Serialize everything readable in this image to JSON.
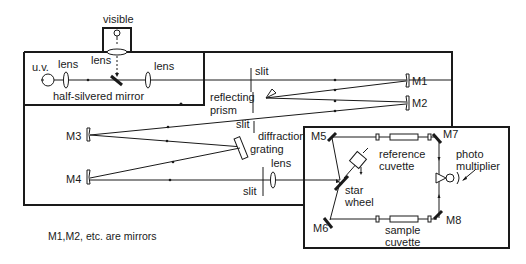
{
  "diagram": {
    "labels": {
      "visible": "visible",
      "uv": "u.v.",
      "lens_1": "lens",
      "lens_2": "lens",
      "lens_3": "lens",
      "lens_4": "lens",
      "half_silvered_mirror": "half-silvered mirror",
      "slit_1": "slit",
      "slit_2": "slit",
      "slit_3": "slit",
      "reflecting_prism_line1": "reflecting",
      "reflecting_prism_line2": "prism",
      "diffraction_grating_line1": "diffraction",
      "diffraction_grating_line2": "grating",
      "m1": "M1",
      "m2": "M2",
      "m3": "M3",
      "m4": "M4",
      "m5": "M5",
      "m6": "M6",
      "m7": "M7",
      "m8": "M8",
      "reference_cuvette_line1": "reference",
      "reference_cuvette_line2": "cuvette",
      "sample_cuvette_line1": "sample",
      "sample_cuvette_line2": "cuvette",
      "star_wheel_line1": "star",
      "star_wheel_line2": "wheel",
      "photomultiplier_line1": "photo",
      "photomultiplier_line2": "multiplier"
    },
    "note": "M1,M2, etc. are mirrors",
    "colors": {
      "ink": "#1a1a1a",
      "background": "#ffffff"
    }
  }
}
